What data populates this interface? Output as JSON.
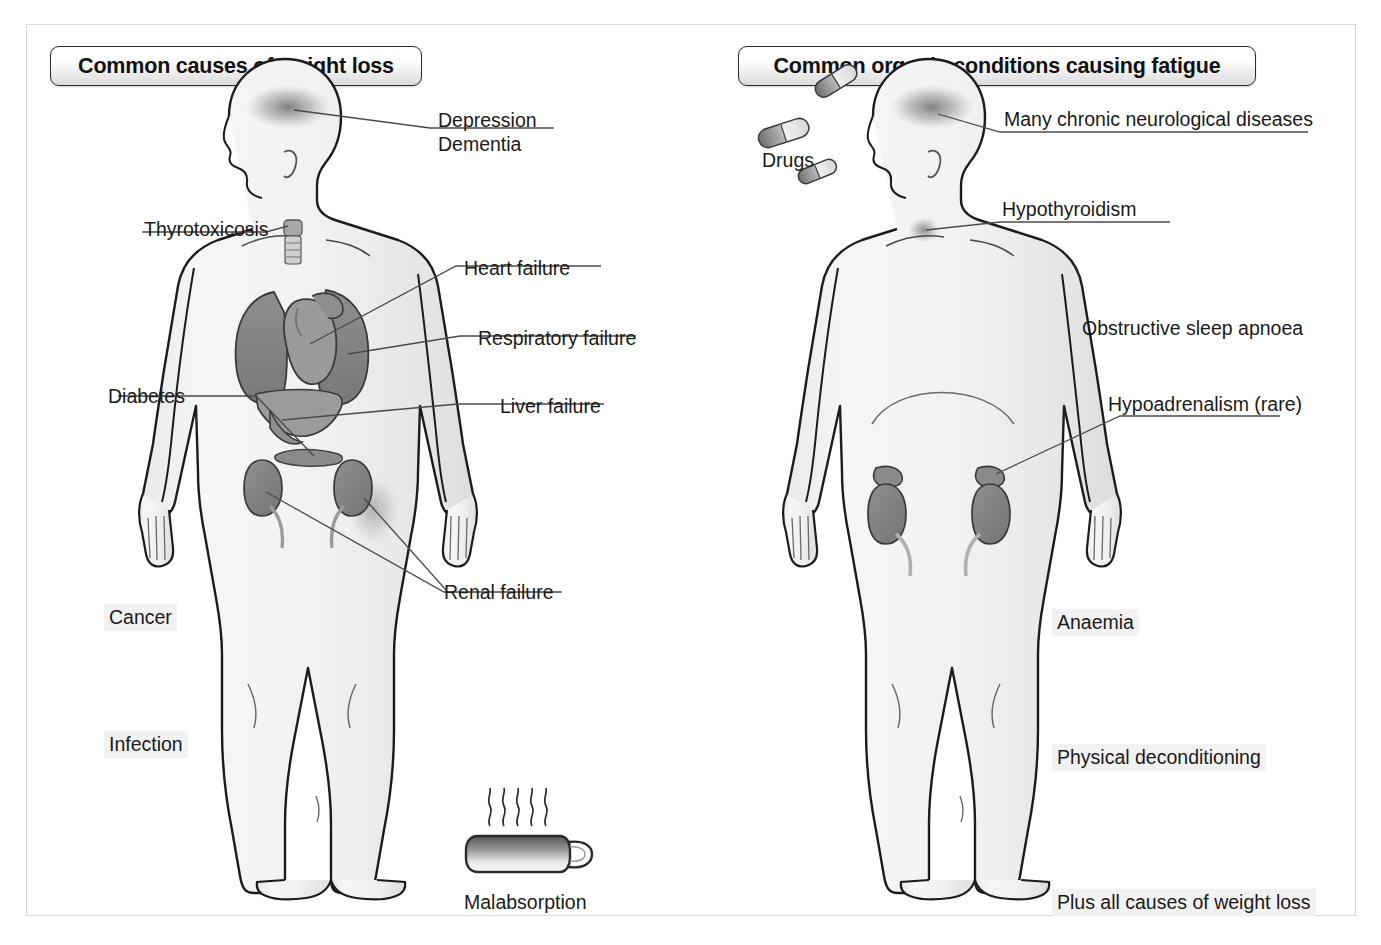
{
  "page": {
    "background": "#ffffff",
    "border_color": "#d8d8d8"
  },
  "panels": [
    {
      "id": "weight-loss",
      "title": "Common causes of weight loss",
      "figure_alt": "Front view of human body silhouette showing brain, thyroid, heart, lungs, liver, pancreas and kidneys",
      "labels": [
        {
          "id": "depression",
          "text": "Depression"
        },
        {
          "id": "dementia",
          "text": "Dementia"
        },
        {
          "id": "thyrotoxicosis",
          "text": "Thyrotoxicosis"
        },
        {
          "id": "heart-failure",
          "text": "Heart failure"
        },
        {
          "id": "respiratory-failure",
          "text": "Respiratory failure"
        },
        {
          "id": "diabetes",
          "text": "Diabetes"
        },
        {
          "id": "liver-failure",
          "text": "Liver failure"
        },
        {
          "id": "renal-failure",
          "text": "Renal failure"
        },
        {
          "id": "cancer",
          "text": "Cancer"
        },
        {
          "id": "infection",
          "text": "Infection"
        },
        {
          "id": "malabsorption",
          "text": "Malabsorption"
        }
      ],
      "icons": [
        {
          "id": "mug-icon",
          "name": "steaming-mug-icon",
          "caption": "Malabsorption"
        }
      ]
    },
    {
      "id": "fatigue",
      "title": "Common organic conditions causing fatigue",
      "figure_alt": "Front view of human body silhouette showing brain, thyroid and kidneys with adrenal glands",
      "labels": [
        {
          "id": "drugs",
          "text": "Drugs"
        },
        {
          "id": "neurological",
          "text": "Many chronic neurological diseases"
        },
        {
          "id": "hypothyroidism",
          "text": "Hypothyroidism"
        },
        {
          "id": "sleep-apnoea",
          "text": "Obstructive sleep apnoea"
        },
        {
          "id": "hypoadrenalism",
          "text": "Hypoadrenalism (rare)"
        },
        {
          "id": "anaemia",
          "text": "Anaemia"
        },
        {
          "id": "physical-deconditioning",
          "text": "Physical deconditioning"
        },
        {
          "id": "plus-weight-loss",
          "text": "Plus all causes of weight loss"
        }
      ],
      "icons": [
        {
          "id": "pills-icon",
          "name": "capsule-pills-icon",
          "caption": "Drugs"
        }
      ]
    }
  ],
  "colors": {
    "body_fill": "#f2f2f2",
    "body_stroke": "#1c1c1c",
    "organ_dark": "#8c8c8c",
    "organ_mid": "#a6a6a6",
    "organ_light": "#c4c4c4",
    "leader_line": "#4a4a4a",
    "label_shade": "#f2f2f2",
    "title_border": "#2b2b2b"
  }
}
